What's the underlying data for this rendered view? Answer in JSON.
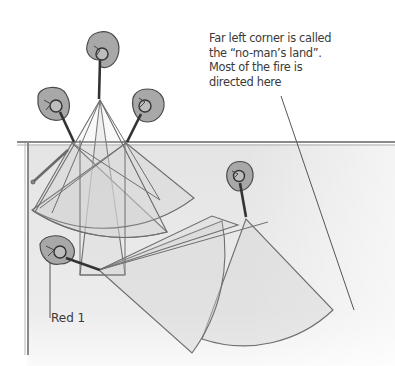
{
  "diagram": {
    "callout": {
      "lines": [
        "Far left corner is called",
        "the “no-man’s land”.",
        "Most of the fire is",
        "directed here"
      ]
    },
    "labels": {
      "red1": "Red 1"
    },
    "players": [
      {
        "id": "top-center",
        "x": 100,
        "y": 50
      },
      {
        "id": "top-left",
        "x": 55,
        "y": 100
      },
      {
        "id": "top-right",
        "x": 145,
        "y": 100
      },
      {
        "id": "right",
        "x": 238,
        "y": 172
      },
      {
        "id": "red-1",
        "x": 58,
        "y": 248
      }
    ],
    "colors": {
      "fan_fill": "#d9d9d9",
      "fan_stroke": "#6e6e6e",
      "board": "#e6e6e6",
      "wall": "#8a8a8a",
      "player_fill": "#a8a8a8",
      "player_stroke": "#4a4a4a",
      "text": "#3a3a3a"
    }
  }
}
